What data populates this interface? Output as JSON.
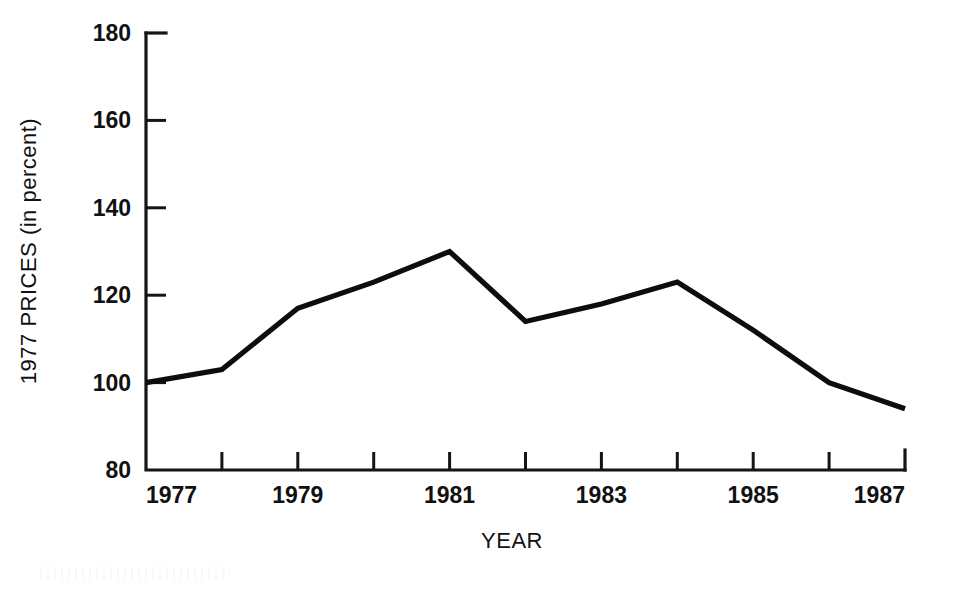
{
  "chart_data": {
    "type": "line",
    "title": "",
    "xlabel": "YEAR",
    "ylabel": "1977 PRICES (in percent)",
    "x": [
      1977,
      1978,
      1979,
      1980,
      1981,
      1982,
      1983,
      1984,
      1985,
      1986,
      1987
    ],
    "values": [
      100,
      103,
      117,
      123,
      130,
      114,
      118,
      123,
      112,
      100,
      94
    ],
    "series": [
      {
        "name": "1977 prices index",
        "values": [
          100,
          103,
          117,
          123,
          130,
          114,
          118,
          123,
          112,
          100,
          94
        ]
      }
    ],
    "xlim": [
      1977,
      1987
    ],
    "ylim": [
      80,
      180
    ],
    "x_tick_values": [
      1977,
      1978,
      1979,
      1980,
      1981,
      1982,
      1983,
      1984,
      1985,
      1986,
      1987
    ],
    "x_tick_labels": [
      "1977",
      "",
      "1979",
      "",
      "1981",
      "",
      "1983",
      "",
      "1985",
      "",
      "1987"
    ],
    "x_labeled_ticks": [
      {
        "value": 1977,
        "label": "1977"
      },
      {
        "value": 1979,
        "label": "1979"
      },
      {
        "value": 1981,
        "label": "1981"
      },
      {
        "value": 1983,
        "label": "1983"
      },
      {
        "value": 1985,
        "label": "1985"
      },
      {
        "value": 1987,
        "label": "1987"
      }
    ],
    "y_tick_values": [
      80,
      100,
      120,
      140,
      160,
      180
    ],
    "y_tick_labels": [
      "80",
      "100",
      "120",
      "140",
      "160",
      "180"
    ],
    "grid": false,
    "legend": false,
    "legend_position": "none",
    "line_color": "#0d0d0d",
    "background_color": "#ffffff"
  },
  "axes": {
    "y_title": "1977 PRICES (in percent)",
    "x_title": "YEAR",
    "y_labels": {
      "t180": "180",
      "t160": "160",
      "t140": "140",
      "t120": "120",
      "t100": "100",
      "t80": "80"
    },
    "x_labels": {
      "y1977": "1977",
      "y1979": "1979",
      "y1981": "1981",
      "y1983": "1983",
      "y1985": "1985",
      "y1987": "1987"
    }
  }
}
